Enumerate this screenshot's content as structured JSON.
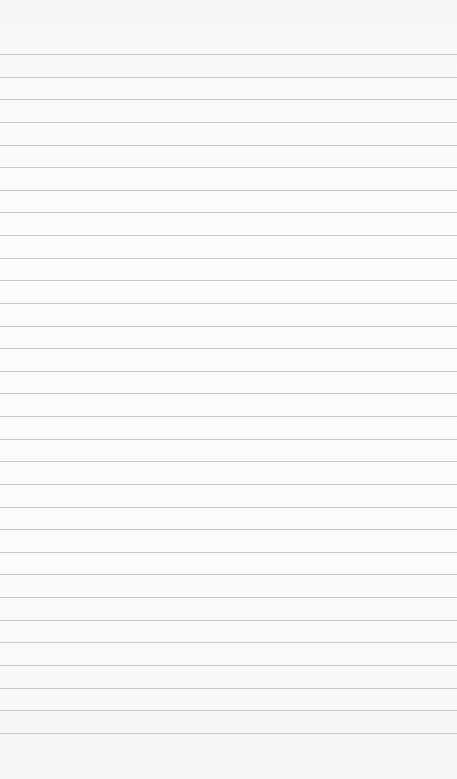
{
  "page": {
    "type": "ruled-notepad-page",
    "line_count": 31,
    "paper_color": "#fbfbfb",
    "line_color": "#c9c9c9",
    "text": ""
  }
}
